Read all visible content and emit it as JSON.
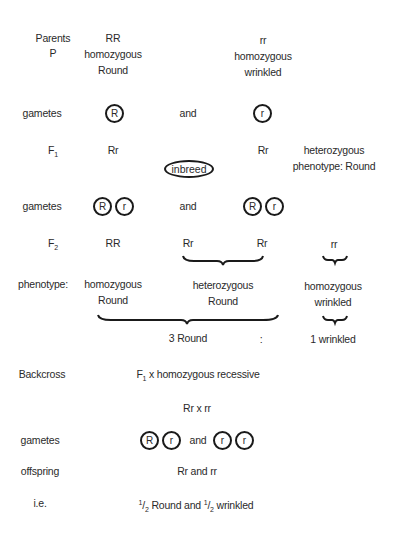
{
  "parents": {
    "label_line1": "Parents",
    "label_line2": "P",
    "left": {
      "genotype": "RR",
      "zygosity": "homozygous",
      "phenotype": "Round"
    },
    "right": {
      "genotype": "rr",
      "zygosity": "homozygous",
      "phenotype": "wrinkled"
    }
  },
  "gametes1": {
    "label": "gametes",
    "left": [
      "R"
    ],
    "joiner": "and",
    "right": [
      "r"
    ]
  },
  "f1": {
    "label_base": "F",
    "label_sub": "1",
    "left": "Rr",
    "right": "Rr",
    "cross_label": "inbreed",
    "note_line1": "heterozygous",
    "note_line2": "phenotype: Round"
  },
  "gametes2": {
    "label": "gametes",
    "left": [
      "R",
      "r"
    ],
    "joiner": "and",
    "right": [
      "R",
      "r"
    ]
  },
  "f2": {
    "label_base": "F",
    "label_sub": "2",
    "genotypes": [
      "RR",
      "Rr",
      "Rr",
      "rr"
    ]
  },
  "phenotype": {
    "label": "phenotype:",
    "groups": [
      {
        "line1": "homozygous",
        "line2": "Round"
      },
      {
        "line1": "heterozygous",
        "line2": "Round"
      },
      {
        "line1": "homozygous",
        "line2": "wrinkled"
      }
    ]
  },
  "ratio": {
    "dominant": "3 Round",
    "separator": ":",
    "recessive": "1 wrinkled"
  },
  "backcross": {
    "label": "Backcross",
    "desc_base": "F",
    "desc_sub": "1",
    "desc_rest": " x homozygous recessive",
    "cross": "Rr x rr"
  },
  "gametes3": {
    "label": "gametes",
    "left": [
      "R",
      "r"
    ],
    "joiner": "and",
    "right": [
      "r",
      "r"
    ]
  },
  "offspring": {
    "label": "offspring",
    "value": "Rr and rr"
  },
  "ie": {
    "label": "i.e.",
    "frac_num": "1",
    "frac_den": "2",
    "part1": " Round and ",
    "part2": " wrinkled"
  }
}
